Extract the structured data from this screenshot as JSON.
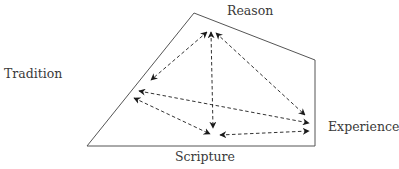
{
  "diagram": {
    "type": "quadrilateral-with-bidirectional-arrows",
    "nodes": {
      "reason": {
        "label": "Reason"
      },
      "tradition": {
        "label": "Tradition"
      },
      "experience": {
        "label": "Experience"
      },
      "scripture": {
        "label": "Scripture"
      }
    },
    "edges": [
      {
        "from": "Reason",
        "to": "Tradition",
        "style": "dashed",
        "direction": "both"
      },
      {
        "from": "Reason",
        "to": "Scripture",
        "style": "dashed",
        "direction": "both"
      },
      {
        "from": "Reason",
        "to": "Experience",
        "style": "dashed",
        "direction": "both"
      },
      {
        "from": "Tradition",
        "to": "Experience",
        "style": "dashed",
        "direction": "both"
      },
      {
        "from": "Tradition",
        "to": "Scripture",
        "style": "dashed",
        "direction": "both"
      },
      {
        "from": "Scripture",
        "to": "Experience",
        "style": "dashed",
        "direction": "both"
      }
    ],
    "colors": {
      "line": "#555555",
      "arrow": "#1a1a1a",
      "text": "#3a3a3a"
    }
  }
}
